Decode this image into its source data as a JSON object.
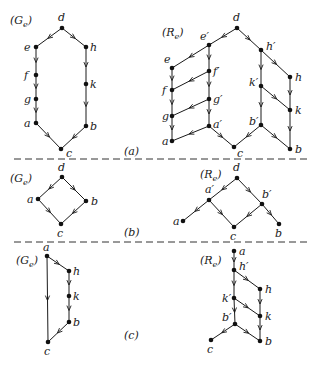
{
  "figure": {
    "panels": [
      {
        "id": "a",
        "caption": "(a)",
        "graphs": [
          {
            "name": "Ge",
            "label": "(G",
            "sub": "e",
            "label_pos": [
              10,
              24
            ],
            "nodes": [
              {
                "id": "d",
                "label": "d",
                "x": 62,
                "y": 28,
                "lx": 58,
                "ly": 21
              },
              {
                "id": "e",
                "label": "e",
                "x": 36,
                "y": 47,
                "lx": 24,
                "ly": 51
              },
              {
                "id": "h",
                "label": "h",
                "x": 86,
                "y": 47,
                "lx": 90,
                "ly": 51
              },
              {
                "id": "f",
                "label": "f",
                "x": 36,
                "y": 75,
                "lx": 24,
                "ly": 79
              },
              {
                "id": "k",
                "label": "k",
                "x": 86,
                "y": 84,
                "lx": 90,
                "ly": 88
              },
              {
                "id": "g",
                "label": "g",
                "x": 36,
                "y": 99,
                "lx": 24,
                "ly": 103
              },
              {
                "id": "a",
                "label": "a",
                "x": 36,
                "y": 123,
                "lx": 24,
                "ly": 127
              },
              {
                "id": "b",
                "label": "b",
                "x": 86,
                "y": 126,
                "lx": 90,
                "ly": 130
              },
              {
                "id": "c",
                "label": "c",
                "x": 61,
                "y": 149,
                "lx": 66,
                "ly": 157
              }
            ],
            "edges": [
              [
                "d",
                "e"
              ],
              [
                "d",
                "h"
              ],
              [
                "e",
                "f"
              ],
              [
                "f",
                "g"
              ],
              [
                "g",
                "a"
              ],
              [
                "h",
                "k"
              ],
              [
                "k",
                "b"
              ],
              [
                "a",
                "c"
              ],
              [
                "b",
                "c"
              ]
            ]
          },
          {
            "name": "Re",
            "label": "(R",
            "sub": "e",
            "label_pos": [
              162,
              36
            ],
            "nodes": [
              {
                "id": "d",
                "label": "d",
                "x": 237,
                "y": 28,
                "lx": 233,
                "ly": 21
              },
              {
                "id": "e1",
                "label": "e′",
                "x": 209,
                "y": 45,
                "lx": 200,
                "ly": 40
              },
              {
                "id": "h1",
                "label": "h′",
                "x": 261,
                "y": 50,
                "lx": 266,
                "ly": 50
              },
              {
                "id": "e",
                "label": "e",
                "x": 172,
                "y": 68,
                "lx": 164,
                "ly": 63
              },
              {
                "id": "f1",
                "label": "f′",
                "x": 209,
                "y": 71,
                "lx": 213,
                "ly": 75
              },
              {
                "id": "f",
                "label": "f",
                "x": 172,
                "y": 90,
                "lx": 162,
                "ly": 94
              },
              {
                "id": "h",
                "label": "h",
                "x": 290,
                "y": 77,
                "lx": 295,
                "ly": 81
              },
              {
                "id": "k1",
                "label": "k′",
                "x": 261,
                "y": 86,
                "lx": 249,
                "ly": 86
              },
              {
                "id": "g1",
                "label": "g′",
                "x": 209,
                "y": 99,
                "lx": 213,
                "ly": 103
              },
              {
                "id": "k",
                "label": "k",
                "x": 290,
                "y": 110,
                "lx": 295,
                "ly": 114
              },
              {
                "id": "g",
                "label": "g",
                "x": 172,
                "y": 116,
                "lx": 162,
                "ly": 120
              },
              {
                "id": "b1",
                "label": "b′",
                "x": 261,
                "y": 125,
                "lx": 249,
                "ly": 125
              },
              {
                "id": "a1",
                "label": "a′",
                "x": 209,
                "y": 126,
                "lx": 213,
                "ly": 128
              },
              {
                "id": "a",
                "label": "a",
                "x": 172,
                "y": 141,
                "lx": 162,
                "ly": 145
              },
              {
                "id": "c",
                "label": "c",
                "x": 234,
                "y": 147,
                "lx": 237,
                "ly": 157
              },
              {
                "id": "b",
                "label": "b",
                "x": 290,
                "y": 149,
                "lx": 295,
                "ly": 153
              }
            ],
            "edges": [
              [
                "d",
                "e1"
              ],
              [
                "d",
                "h1"
              ],
              [
                "e1",
                "e"
              ],
              [
                "e1",
                "f1"
              ],
              [
                "f1",
                "f"
              ],
              [
                "f1",
                "g1"
              ],
              [
                "g1",
                "g"
              ],
              [
                "g1",
                "a1"
              ],
              [
                "a1",
                "a"
              ],
              [
                "a1",
                "c"
              ],
              [
                "e",
                "f"
              ],
              [
                "f",
                "g"
              ],
              [
                "g",
                "a"
              ],
              [
                "h1",
                "h"
              ],
              [
                "h1",
                "k1"
              ],
              [
                "k1",
                "k"
              ],
              [
                "k1",
                "b1"
              ],
              [
                "b1",
                "c"
              ],
              [
                "b1",
                "b"
              ],
              [
                "h",
                "k"
              ],
              [
                "k",
                "b"
              ]
            ]
          }
        ]
      },
      {
        "id": "b",
        "caption": "(b)",
        "graphs": [
          {
            "name": "Ge",
            "label": "(G",
            "sub": "e",
            "label_pos": [
              10,
              182
            ],
            "nodes": [
              {
                "id": "d",
                "label": "d",
                "x": 62,
                "y": 177,
                "lx": 58,
                "ly": 171
              },
              {
                "id": "a",
                "label": "a",
                "x": 38,
                "y": 199,
                "lx": 27,
                "ly": 203
              },
              {
                "id": "b",
                "label": "b",
                "x": 86,
                "y": 201,
                "lx": 91,
                "ly": 205
              },
              {
                "id": "c",
                "label": "c",
                "x": 61,
                "y": 224,
                "lx": 57,
                "ly": 237
              }
            ],
            "edges": [
              [
                "d",
                "a"
              ],
              [
                "d",
                "b"
              ],
              [
                "a",
                "c"
              ],
              [
                "b",
                "c"
              ]
            ]
          },
          {
            "name": "Re",
            "label": "(R",
            "sub": "e",
            "label_pos": [
              200,
              178
            ],
            "nodes": [
              {
                "id": "d",
                "label": "d",
                "x": 237,
                "y": 178,
                "lx": 233,
                "ly": 171
              },
              {
                "id": "a1",
                "label": "a′",
                "x": 209,
                "y": 200,
                "lx": 205,
                "ly": 193
              },
              {
                "id": "b1",
                "label": "b′",
                "x": 262,
                "y": 204,
                "lx": 262,
                "ly": 198
              },
              {
                "id": "a",
                "label": "a",
                "x": 183,
                "y": 221,
                "lx": 173,
                "ly": 225
              },
              {
                "id": "c",
                "label": "c",
                "x": 234,
                "y": 227,
                "lx": 230,
                "ly": 240
              },
              {
                "id": "b",
                "label": "b",
                "x": 279,
                "y": 224,
                "lx": 275,
                "ly": 237
              }
            ],
            "edges": [
              [
                "d",
                "a1"
              ],
              [
                "d",
                "b1"
              ],
              [
                "a1",
                "a"
              ],
              [
                "a1",
                "c"
              ],
              [
                "b1",
                "c"
              ],
              [
                "b1",
                "b"
              ]
            ]
          }
        ]
      },
      {
        "id": "c",
        "caption": "(c)",
        "graphs": [
          {
            "name": "Ge",
            "label": "(G",
            "sub": "e",
            "label_pos": [
              16,
              264
            ],
            "nodes": [
              {
                "id": "a",
                "label": "a",
                "x": 47,
                "y": 256,
                "lx": 43,
                "ly": 251
              },
              {
                "id": "h",
                "label": "h",
                "x": 69,
                "y": 271,
                "lx": 73,
                "ly": 275
              },
              {
                "id": "k",
                "label": "k",
                "x": 69,
                "y": 296,
                "lx": 73,
                "ly": 300
              },
              {
                "id": "b",
                "label": "b",
                "x": 69,
                "y": 322,
                "lx": 73,
                "ly": 326
              },
              {
                "id": "c",
                "label": "c",
                "x": 48,
                "y": 342,
                "lx": 44,
                "ly": 355
              }
            ],
            "edges": [
              [
                "a",
                "h"
              ],
              [
                "h",
                "k"
              ],
              [
                "k",
                "b"
              ],
              [
                "b",
                "c"
              ],
              [
                "a",
                "c"
              ]
            ]
          },
          {
            "name": "Re",
            "label": "(R",
            "sub": "e",
            "label_pos": [
              200,
              264
            ],
            "nodes": [
              {
                "id": "a",
                "label": "a",
                "x": 234,
                "y": 251,
                "lx": 239,
                "ly": 255
              },
              {
                "id": "h1",
                "label": "h′",
                "x": 234,
                "y": 270,
                "lx": 239,
                "ly": 270
              },
              {
                "id": "h",
                "label": "h",
                "x": 260,
                "y": 289,
                "lx": 265,
                "ly": 293
              },
              {
                "id": "k1",
                "label": "k′",
                "x": 234,
                "y": 298,
                "lx": 222,
                "ly": 302
              },
              {
                "id": "k",
                "label": "k",
                "x": 260,
                "y": 316,
                "lx": 265,
                "ly": 320
              },
              {
                "id": "b1",
                "label": "b′",
                "x": 235,
                "y": 324,
                "lx": 222,
                "ly": 321
              },
              {
                "id": "c",
                "label": "c",
                "x": 211,
                "y": 340,
                "lx": 207,
                "ly": 353
              },
              {
                "id": "b",
                "label": "b",
                "x": 260,
                "y": 341,
                "lx": 265,
                "ly": 345
              }
            ],
            "edges": [
              [
                "a",
                "h1"
              ],
              [
                "h1",
                "h"
              ],
              [
                "h1",
                "k1"
              ],
              [
                "k1",
                "k"
              ],
              [
                "k1",
                "b1"
              ],
              [
                "b1",
                "c"
              ],
              [
                "b1",
                "b"
              ],
              [
                "h",
                "k"
              ],
              [
                "k",
                "b"
              ]
            ]
          }
        ]
      }
    ],
    "captions": [
      {
        "text": "(a)",
        "x": 124,
        "y": 155
      },
      {
        "text": "(b)",
        "x": 124,
        "y": 236
      },
      {
        "text": "(c)",
        "x": 124,
        "y": 339
      }
    ],
    "dividers": [
      {
        "x1": 14,
        "x2": 308,
        "y": 159
      },
      {
        "x1": 14,
        "x2": 308,
        "y": 242
      }
    ]
  }
}
